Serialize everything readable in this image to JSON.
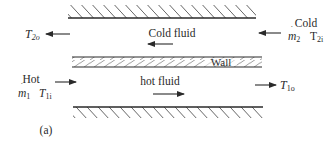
{
  "diagram": {
    "caption": "(a)",
    "wall_label": "Wall",
    "cold_stream": {
      "inlet_label": "Cold",
      "mass_flow": {
        "symbol": "m",
        "sub": "2"
      },
      "inlet_temp": {
        "symbol": "T",
        "sub": "2i"
      },
      "outlet_temp": {
        "symbol": "T",
        "sub": "2o"
      },
      "channel_label": "Cold fluid",
      "direction": "left"
    },
    "hot_stream": {
      "inlet_label": "Hot",
      "mass_flow": {
        "symbol": "m",
        "sub": "1"
      },
      "inlet_temp": {
        "symbol": "T",
        "sub": "1i"
      },
      "outlet_temp": {
        "symbol": "T",
        "sub": "1o"
      },
      "channel_label": "hot fluid",
      "direction": "right"
    },
    "colors": {
      "line": "#2a2a2a",
      "hatch": "#555555",
      "background": "#ffffff"
    }
  }
}
